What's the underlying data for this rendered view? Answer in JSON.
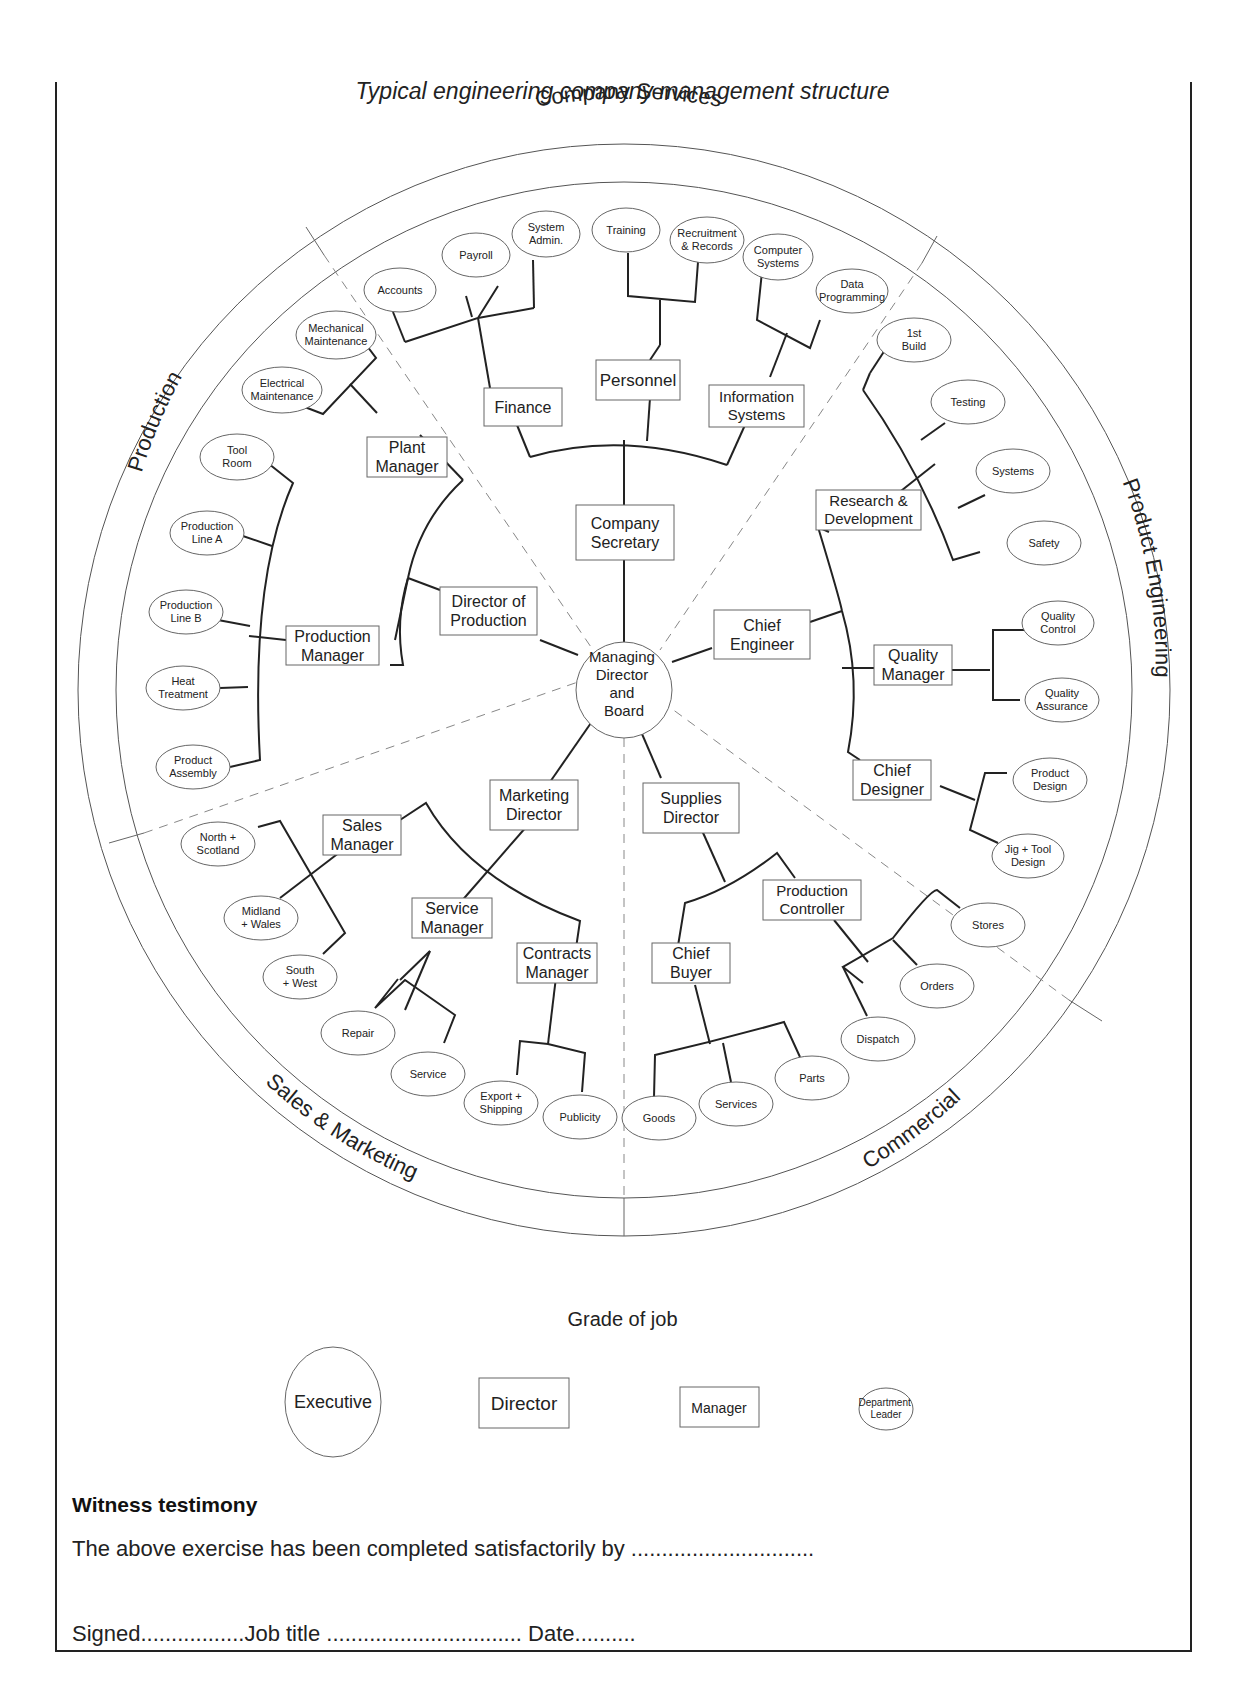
{
  "caption": "Typical engineering company management structure",
  "sectors": {
    "top": "Company Services",
    "left": "Production",
    "right": "Product Engineering",
    "bottom_left": "Sales & Marketing",
    "bottom_right": "Commercial"
  },
  "center": {
    "label_lines": [
      "Managing",
      "Director",
      "and",
      "Board"
    ],
    "grade": "Executive"
  },
  "nodes": {
    "company_secretary": [
      "Company",
      "Secretary"
    ],
    "finance": [
      "Finance"
    ],
    "personnel": [
      "Personnel"
    ],
    "information_systems": [
      "Information",
      "Systems"
    ],
    "accounts": [
      "Accounts"
    ],
    "payroll": [
      "Payroll"
    ],
    "system_admin": [
      "System",
      "Admin."
    ],
    "training": [
      "Training"
    ],
    "recruitment": [
      "Recruitment",
      "& Records"
    ],
    "computer_systems": [
      "Computer",
      "Systems"
    ],
    "data_programming": [
      "Data",
      "Programming"
    ],
    "director_of_production": [
      "Director of",
      "Production"
    ],
    "plant_manager": [
      "Plant",
      "Manager"
    ],
    "production_manager": [
      "Production",
      "Manager"
    ],
    "mechanical_maintenance": [
      "Mechanical",
      "Maintenance"
    ],
    "electrical_maintenance": [
      "Electrical",
      "Maintenance"
    ],
    "tool_room": [
      "Tool",
      "Room"
    ],
    "production_line_a": [
      "Production",
      "Line A"
    ],
    "production_line_b": [
      "Production",
      "Line B"
    ],
    "heat_treatment": [
      "Heat",
      "Treatment"
    ],
    "product_assembly": [
      "Product",
      "Assembly"
    ],
    "chief_engineer": [
      "Chief",
      "Engineer"
    ],
    "research_development": [
      "Research &",
      "Development"
    ],
    "quality_manager": [
      "Quality",
      "Manager"
    ],
    "chief_designer": [
      "Chief",
      "Designer"
    ],
    "first_build": [
      "1st",
      "Build"
    ],
    "testing": [
      "Testing"
    ],
    "systems": [
      "Systems"
    ],
    "safety": [
      "Safety"
    ],
    "quality_control": [
      "Quality",
      "Control"
    ],
    "quality_assurance": [
      "Quality",
      "Assurance"
    ],
    "product_design": [
      "Product",
      "Design"
    ],
    "jig_tool_design": [
      "Jig + Tool",
      "Design"
    ],
    "marketing_director": [
      "Marketing",
      "Director"
    ],
    "sales_manager": [
      "Sales",
      "Manager"
    ],
    "service_manager": [
      "Service",
      "Manager"
    ],
    "contracts_manager": [
      "Contracts",
      "Manager"
    ],
    "north_scotland": [
      "North +",
      "Scotland"
    ],
    "midland_wales": [
      "Midland",
      "+ Wales"
    ],
    "south_west": [
      "South",
      "+ West"
    ],
    "repair": [
      "Repair"
    ],
    "service": [
      "Service"
    ],
    "export_shipping": [
      "Export +",
      "Shipping"
    ],
    "publicity": [
      "Publicity"
    ],
    "supplies_director": [
      "Supplies",
      "Director"
    ],
    "production_controller": [
      "Production",
      "Controller"
    ],
    "chief_buyer": [
      "Chief",
      "Buyer"
    ],
    "stores": [
      "Stores"
    ],
    "orders": [
      "Orders"
    ],
    "dispatch": [
      "Dispatch"
    ],
    "goods": [
      "Goods"
    ],
    "services": [
      "Services"
    ],
    "parts": [
      "Parts"
    ]
  },
  "legend": {
    "title": "Grade of job",
    "items": [
      {
        "shape": "circle",
        "lines": [
          "Executive"
        ]
      },
      {
        "shape": "large-rect",
        "lines": [
          "Director"
        ]
      },
      {
        "shape": "small-rect",
        "lines": [
          "Manager"
        ]
      },
      {
        "shape": "ellipse",
        "lines": [
          "Department",
          "Leader"
        ]
      }
    ]
  },
  "witness": {
    "title": "Witness testimony",
    "line1": "The above exercise has been completed satisfactorily by ..............................",
    "line2": "Signed.................Job title ................................ Date.........."
  }
}
